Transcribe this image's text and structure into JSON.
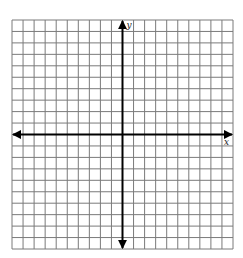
{
  "diagram": {
    "type": "coordinate-plane",
    "grid": {
      "columns": 20,
      "rows": 20,
      "left": 12,
      "top": 20,
      "right": 233,
      "bottom": 249,
      "line_color": "#7a7a7a",
      "background": "#ffffff"
    },
    "axes": {
      "color": "#000000",
      "x_axis_row": 10,
      "y_axis_col": 10,
      "x_label": "x",
      "y_label": "y",
      "arrows": true
    }
  }
}
